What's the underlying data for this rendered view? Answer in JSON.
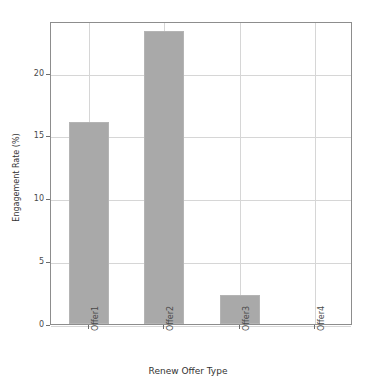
{
  "chart_data": {
    "type": "bar",
    "title": "",
    "xlabel": "Renew Offer Type",
    "ylabel": "Engagement Rate (%)",
    "categories": [
      "Offer1",
      "Offer2",
      "Offer3",
      "Offer4"
    ],
    "values": [
      16.1,
      23.3,
      2.3,
      0.0
    ],
    "ylim": [
      0,
      24.1
    ],
    "yticks": [
      0,
      5,
      10,
      15,
      20
    ],
    "ytick_labels": [
      "0",
      "5",
      "10",
      "15",
      "20"
    ],
    "xtick_labels": [
      "Offer1",
      "Offer2",
      "Offer3",
      "Offer4"
    ],
    "grid": true,
    "legend": "none",
    "bar_color": "#a9a9a9",
    "grid_color": "#d6d6d6",
    "axis_color": "#8d8d8d",
    "background_color": "#ffffff"
  }
}
